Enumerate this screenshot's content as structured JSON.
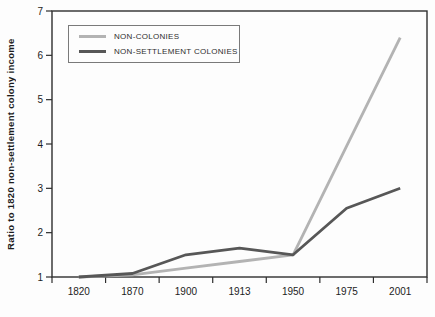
{
  "figure": {
    "background": "#fdfdfd",
    "frame_color": "#2e2e2e",
    "text_color": "#1c1c1c"
  },
  "chart_data": {
    "type": "line",
    "title": "",
    "xlabel": "",
    "ylabel": "Ratio to 1820 non-settlement colony income",
    "categories": [
      "1820",
      "1870",
      "1900",
      "1913",
      "1950",
      "1975",
      "2001"
    ],
    "series": [
      {
        "name": "NON-COLONIES",
        "values": [
          1.0,
          1.05,
          1.2,
          1.35,
          1.5,
          3.95,
          6.4
        ],
        "color": "#b3b3b3",
        "width": 2.8
      },
      {
        "name": "NON-SETTLEMENT COLONIES",
        "values": [
          1.0,
          1.08,
          1.5,
          1.65,
          1.5,
          2.55,
          3.0
        ],
        "color": "#575757",
        "width": 2.8
      }
    ],
    "ylim": [
      1,
      7
    ],
    "yticks": [
      "1",
      "2",
      "3",
      "4",
      "5",
      "6",
      "7"
    ],
    "grid": false,
    "legend_position": "top-left"
  }
}
